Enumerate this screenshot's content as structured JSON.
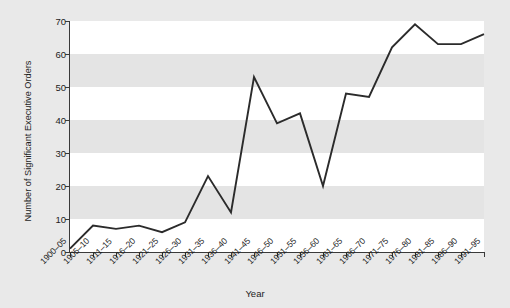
{
  "chart_data": {
    "type": "line",
    "title": "",
    "xlabel": "Year",
    "ylabel": "Number of Significant Executive Orders",
    "categories": [
      "1900–05",
      "1905–10",
      "1911–15",
      "1916–20",
      "1921–25",
      "1926–30",
      "1931–35",
      "1936–40",
      "1941–45",
      "1946–50",
      "1951–55",
      "1956–60",
      "1961–65",
      "1966–70",
      "1971–75",
      "1976–80",
      "1981–85",
      "1986–90",
      "1991–95"
    ],
    "values": [
      1,
      8,
      7,
      8,
      6,
      9,
      23,
      12,
      53,
      39,
      42,
      20,
      48,
      47,
      62,
      69,
      63,
      63,
      66
    ],
    "ylim": [
      0,
      70
    ],
    "yticks": [
      0,
      10,
      20,
      30,
      40,
      50,
      60,
      70
    ],
    "ytick_labels": [
      "0",
      "10",
      "20",
      "30",
      "40",
      "50",
      "60",
      "70"
    ],
    "grid": "alternating-horizontal-bands",
    "legend": "none",
    "line_color": "#2b2b2b",
    "plot_background": "#ffffff",
    "band_color": "#e4e4e4",
    "figure_background": "#e9e9e9"
  }
}
